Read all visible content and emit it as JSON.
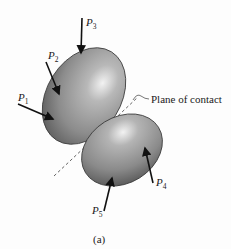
{
  "figure": {
    "caption": "(a)",
    "annotation": "Plane of contact",
    "forces": [
      {
        "id": "P1",
        "letter": "P",
        "subscript": "1"
      },
      {
        "id": "P2",
        "letter": "P",
        "subscript": "2"
      },
      {
        "id": "P3",
        "letter": "P",
        "subscript": "3"
      },
      {
        "id": "P4",
        "letter": "P",
        "subscript": "4"
      },
      {
        "id": "P5",
        "letter": "P",
        "subscript": "5"
      }
    ],
    "colors": {
      "body_dark": "#6e6e6e",
      "body_mid": "#9a9a9a",
      "body_light": "#e4e4e4",
      "outline": "#3a3a3a",
      "arrow": "#111111",
      "dashed_line": "#555555"
    }
  }
}
